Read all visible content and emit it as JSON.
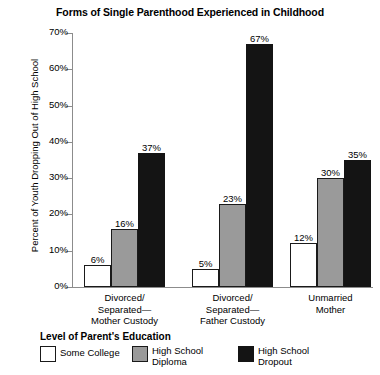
{
  "chart_data": {
    "type": "bar",
    "title": "Forms of Single Parenthood Experienced in Childhood",
    "xlabel": "",
    "ylabel": "Percent of Youth Dropping Out of High School",
    "ylim": [
      0,
      70
    ],
    "ytick_labels": [
      "0%",
      "10%",
      "20%",
      "30%",
      "40%",
      "50%",
      "60%",
      "70%"
    ],
    "ytick_values": [
      0,
      10,
      20,
      30,
      40,
      50,
      60,
      70
    ],
    "grid": false,
    "legend_position": "bottom",
    "legend_title": "Level of Parent's Education",
    "categories": [
      "Divorced/\nSeparated—\nMother Custody",
      "Divorced/\nSeparated—\nFather Custody",
      "Unmarried\nMother"
    ],
    "series": [
      {
        "name": "Some College",
        "color": "#ffffff",
        "values": [
          6,
          5,
          12
        ],
        "labels": [
          "6%",
          "5%",
          "12%"
        ]
      },
      {
        "name": "High School\nDiploma",
        "color": "#9a9a9a",
        "values": [
          16,
          23,
          30
        ],
        "labels": [
          "16%",
          "23%",
          "30%"
        ]
      },
      {
        "name": "High School\nDropout",
        "color": "#141414",
        "values": [
          37,
          67,
          35
        ],
        "labels": [
          "37%",
          "67%",
          "35%"
        ]
      }
    ]
  },
  "legend": {
    "title": "Level of Parent's Education",
    "items": [
      {
        "label": "Some College"
      },
      {
        "label": "High School\nDiploma"
      },
      {
        "label": "High School\nDropout"
      }
    ]
  },
  "axis": {
    "y_title": "Percent of Youth Dropping Out of High School"
  }
}
